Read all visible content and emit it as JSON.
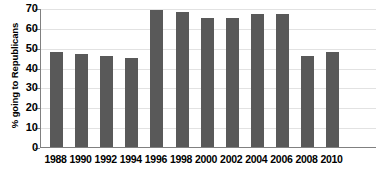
{
  "chart_data": {
    "type": "bar",
    "title": "",
    "xlabel": "",
    "ylabel": "% going to Republicans",
    "ylim": [
      0,
      70
    ],
    "yticks": [
      0,
      10,
      20,
      30,
      40,
      50,
      60,
      70
    ],
    "grid": true,
    "legend": "none",
    "bar_color": "#595959",
    "axis_color": "#808080",
    "categories": [
      "1988",
      "1990",
      "1992",
      "1994",
      "1996",
      "1998",
      "2000",
      "2002",
      "2004",
      "2006",
      "2008",
      "2010"
    ],
    "values": [
      48,
      47,
      46,
      45,
      69,
      68,
      65,
      65,
      67,
      67,
      46,
      48
    ]
  }
}
